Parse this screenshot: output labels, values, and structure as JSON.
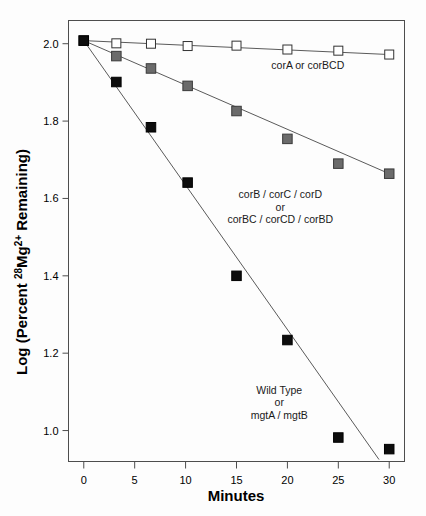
{
  "chart_data": {
    "type": "scatter",
    "title": "",
    "xlabel": "Minutes",
    "ylabel_parts": {
      "prefix": "Log (Percent ",
      "superscript": "28",
      "element": "Mg",
      "charge": "2+",
      "suffix": " Remaining)"
    },
    "ylabel": "Log (Percent 28Mg2+ Remaining)",
    "xlim": [
      -1.5,
      31.5
    ],
    "ylim": [
      0.92,
      2.06
    ],
    "xticks": [
      0,
      5,
      10,
      15,
      20,
      25,
      30
    ],
    "yticks": [
      1.0,
      1.2,
      1.4,
      1.6,
      1.8,
      2.0
    ],
    "xtick_labels": [
      "0",
      "5",
      "10",
      "15",
      "20",
      "25",
      "30"
    ],
    "ytick_labels": [
      "1.0",
      "1.2",
      "1.4",
      "1.6",
      "1.8",
      "2.0"
    ],
    "grid": false,
    "legend_position": "inline-annotations",
    "series": [
      {
        "name": "corA or corBCD",
        "marker": "open-square",
        "marker_fill": "#ffffff",
        "marker_stroke": "#333333",
        "line_color": "#5a5a5a",
        "x": [
          0,
          3.2,
          6.6,
          10.2,
          15.0,
          20.0,
          25.0,
          30.0
        ],
        "y": [
          2.008,
          2.001,
          2.0,
          1.994,
          1.995,
          1.985,
          1.982,
          1.972
        ],
        "annotation": {
          "text": "corA or corBCD",
          "x": 22.0,
          "y": 1.935
        }
      },
      {
        "name": "corB / corC / corD or corBC / corCD / corBD",
        "marker": "filled-square",
        "marker_fill": "#6b6b6b",
        "marker_stroke": "#3a3a3a",
        "line_color": "#5a5a5a",
        "x": [
          0,
          3.2,
          6.6,
          10.2,
          15.0,
          20.0,
          25.0,
          30.0
        ],
        "y": [
          2.008,
          1.968,
          1.936,
          1.891,
          1.826,
          1.754,
          1.69,
          1.664
        ],
        "annotation_lines": [
          "corB / corC / corD",
          "or",
          "corBC / corCD / corBD"
        ],
        "annotation": {
          "x": 19.3,
          "y": 1.6
        }
      },
      {
        "name": "Wild Type or mgtA / mgtB",
        "marker": "filled-square",
        "marker_fill": "#0d0d0d",
        "marker_stroke": "#000000",
        "line_color": "#5a5a5a",
        "x": [
          0,
          3.2,
          6.6,
          10.2,
          15.0,
          20.0,
          25.0,
          30.0
        ],
        "y": [
          2.008,
          1.901,
          1.784,
          1.641,
          1.4,
          1.234,
          0.982,
          0.952
        ],
        "annotation_lines": [
          "Wild Type",
          "or",
          "mgtA / mgtB"
        ],
        "annotation": {
          "x": 19.2,
          "y": 1.095
        }
      }
    ],
    "trendlines": [
      {
        "series": "corA or corBCD",
        "x1": 0,
        "y1": 2.008,
        "x2": 30,
        "y2": 1.972
      },
      {
        "series": "corB / corC / corD or corBC / corCD / corBD",
        "x1": 0,
        "y1": 2.008,
        "x2": 30,
        "y2": 1.664
      },
      {
        "series": "Wild Type or mgtA / mgtB",
        "x1": 0,
        "y1": 2.008,
        "x2": 29.0,
        "y2": 0.925
      }
    ]
  }
}
